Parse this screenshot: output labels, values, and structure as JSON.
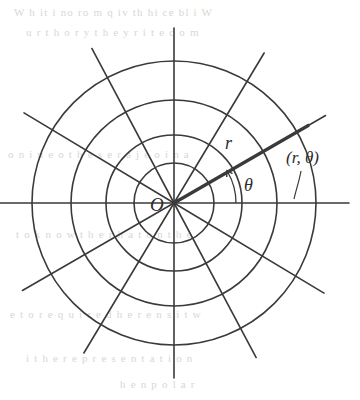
{
  "figure": {
    "kind": "polar-coordinate-grid-diagram",
    "background_color": "#ffffff",
    "ink_color": "#3a3a3a",
    "bleed_color": "#cfcabf"
  },
  "chart_data": {
    "type": "scatter",
    "xlabel": "",
    "ylabel": "",
    "coordinate_system": "polar",
    "center": {
      "x": 174,
      "y": 203,
      "label": "O"
    },
    "grid": true,
    "legend": "none",
    "circles": {
      "count": 4,
      "radii_px": [
        40,
        68,
        103,
        142
      ],
      "stroke_width": 1.6
    },
    "spokes": {
      "count": 12,
      "angles_deg": [
        0,
        30,
        59,
        90,
        118,
        149,
        180,
        210,
        239,
        270,
        298,
        329
      ],
      "length_px": 175,
      "stroke_width": 1.6
    },
    "point": {
      "label": "(r, θ)",
      "r_px": 155,
      "theta_deg": 30,
      "ray_stroke_width": 3.2
    },
    "angle_arc": {
      "label": "θ",
      "radius_px": 62,
      "from_deg": 0,
      "to_deg": 30,
      "arrowhead": true
    },
    "annotations": [
      {
        "name": "origin",
        "text": "O",
        "x": 155,
        "y": 206
      },
      {
        "name": "radius",
        "text": "r",
        "x": 229,
        "y": 144
      },
      {
        "name": "theta",
        "text": "θ",
        "x": 248,
        "y": 186
      },
      {
        "name": "point",
        "text": "(r, θ)",
        "x": 290,
        "y": 160
      }
    ]
  },
  "labels": {
    "origin": "O",
    "radius": "r",
    "theta": "θ",
    "point": "(r, θ)"
  },
  "bleed_text": {
    "lines": [
      {
        "text": "W h it  i  no  ro  m  q  iv  th   hi  ce  bl i  W",
        "x": 14,
        "y": 6
      },
      {
        "text": "u  r t h   o r y t     h e   y r   i t  e   c o  m",
        "x": 26,
        "y": 26
      },
      {
        "text": "o n  i n e  o  t h e  s  e   r  a  j     e o i   n  a",
        "x": 8,
        "y": 148
      },
      {
        "text": "t o   k n o w   t h  e  r     h a t    o n    t h e",
        "x": 16,
        "y": 228
      },
      {
        "text": "e   t o   r e q u i r e d    h  e  r   e  n s   i t   w",
        "x": 10,
        "y": 308
      },
      {
        "text": "i   t h e    r  e  p r e s  e n t a t i o n",
        "x": 26,
        "y": 352
      },
      {
        "text": "h  e   n   p  o  l  a  r",
        "x": 120,
        "y": 378
      }
    ]
  }
}
